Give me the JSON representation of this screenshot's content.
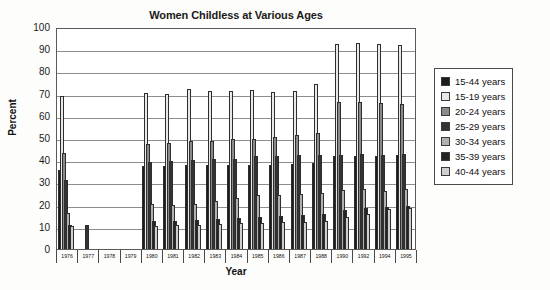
{
  "chart_data": {
    "type": "bar",
    "title": "Women Childless at Various Ages",
    "xlabel": "Year",
    "ylabel": "Percent",
    "ylim": [
      0,
      100
    ],
    "ytick_step": 10,
    "yticks": [
      0,
      10,
      20,
      30,
      40,
      50,
      60,
      70,
      80,
      90,
      100
    ],
    "grid": true,
    "legend_position": "right",
    "categories": [
      "1976",
      "1977",
      "1978",
      "1979",
      "1980",
      "1981",
      "1982",
      "1983",
      "1984",
      "1985",
      "1986",
      "1987",
      "1988",
      "1990",
      "1992",
      "1994",
      "1995"
    ],
    "series": [
      {
        "name": "15-44 years",
        "color": "#1c1c1c",
        "values": [
          35.0,
          null,
          null,
          null,
          36.8,
          36.9,
          37.2,
          37.4,
          37.6,
          37.5,
          37.4,
          37.9,
          38.1,
          41.3,
          41.6,
          41.5,
          41.9
        ]
      },
      {
        "name": "15-19 years",
        "color": "#e8e8e8",
        "values": [
          68.5,
          null,
          null,
          null,
          69.9,
          69.2,
          71.7,
          70.8,
          70.9,
          71.0,
          70.5,
          70.9,
          74.0,
          91.9,
          92.2,
          91.8,
          91.6
        ]
      },
      {
        "name": "20-24 years",
        "color": "#8a8a8a",
        "values": [
          43.0,
          null,
          null,
          null,
          47.0,
          47.4,
          48.0,
          48.4,
          49.0,
          49.3,
          49.8,
          50.7,
          51.6,
          65.8,
          65.9,
          65.3,
          64.8
        ]
      },
      {
        "name": "25-29 years",
        "color": "#333333",
        "values": [
          30.8,
          10.5,
          null,
          null,
          38.9,
          39.3,
          39.5,
          40.0,
          40.2,
          41.5,
          41.4,
          41.8,
          42.0,
          41.8,
          42.4,
          42.1,
          42.5
        ]
      },
      {
        "name": "30-34 years",
        "color": "#b0b0b0",
        "values": [
          15.6,
          null,
          null,
          null,
          19.7,
          19.4,
          20.0,
          21.0,
          22.5,
          23.8,
          23.9,
          24.2,
          24.8,
          26.2,
          26.7,
          25.9,
          26.5
        ]
      },
      {
        "name": "35-39 years",
        "color": "#242424",
        "values": [
          10.5,
          null,
          null,
          null,
          12.1,
          12.3,
          12.5,
          13.0,
          13.5,
          13.8,
          14.2,
          15.0,
          15.5,
          17.3,
          18.2,
          18.6,
          19.0
        ]
      },
      {
        "name": "40-44 years",
        "color": "#cfcfcf",
        "values": [
          9.9,
          null,
          null,
          null,
          10.1,
          10.2,
          10.5,
          10.9,
          11.1,
          11.4,
          11.6,
          11.9,
          12.2,
          14.0,
          15.4,
          17.5,
          17.9
        ]
      }
    ]
  },
  "legend": {
    "items": [
      {
        "label": "15-44 years",
        "color": "#1c1c1c"
      },
      {
        "label": "15-19 years",
        "color": "#e8e8e8"
      },
      {
        "label": "20-24 years",
        "color": "#8a8a8a"
      },
      {
        "label": "25-29 years",
        "color": "#333333"
      },
      {
        "label": "30-34 years",
        "color": "#b0b0b0"
      },
      {
        "label": "35-39 years",
        "color": "#242424"
      },
      {
        "label": "40-44 years",
        "color": "#cfcfcf"
      }
    ]
  }
}
